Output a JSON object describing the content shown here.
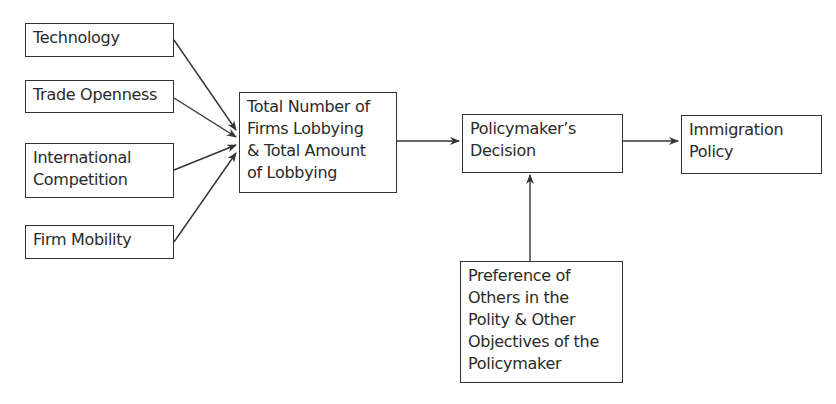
{
  "diagram": {
    "type": "flowchart",
    "nodes": {
      "technology": {
        "label": "Technology"
      },
      "trade_openness": {
        "label": "Trade Openness"
      },
      "international_competition": {
        "label": "International\nCompetition"
      },
      "firm_mobility": {
        "label": "Firm Mobility"
      },
      "lobbying": {
        "label": "Total Number of\nFirms Lobbying\n& Total Amount\nof Lobbying"
      },
      "decision": {
        "label": "Policymaker’s\nDecision"
      },
      "immigration_policy": {
        "label": "Immigration\nPolicy"
      },
      "preferences": {
        "label": "Preference of\nOthers in the\nPolity & Other\nObjectives of the\nPolicymaker"
      }
    },
    "edges": [
      {
        "from": "technology",
        "to": "lobbying"
      },
      {
        "from": "trade_openness",
        "to": "lobbying"
      },
      {
        "from": "international_competition",
        "to": "lobbying"
      },
      {
        "from": "firm_mobility",
        "to": "lobbying"
      },
      {
        "from": "lobbying",
        "to": "decision"
      },
      {
        "from": "decision",
        "to": "immigration_policy"
      },
      {
        "from": "preferences",
        "to": "decision"
      }
    ],
    "line_color": "#333333"
  }
}
